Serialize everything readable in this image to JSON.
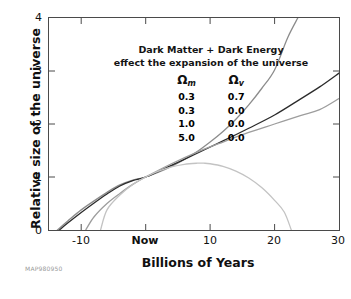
{
  "figure": {
    "credit": "MAP980950"
  },
  "chart_data": {
    "type": "line",
    "title": "Dark Matter + Dark Energy effect the expansion of the universe",
    "title_lines": [
      "Dark Matter + Dark Energy",
      "effect the expansion of the universe"
    ],
    "xlabel": "Billions of Years",
    "ylabel": "Relative size of the universe",
    "xlim": [
      -15,
      30
    ],
    "ylim": [
      0,
      4
    ],
    "grid": false,
    "legend_position": "upper-left-inside",
    "legend_headers": {
      "omega_m": "Ω",
      "omega_m_sub": "m",
      "omega_v": "Ω",
      "omega_v_sub": "v"
    },
    "xticks": [
      {
        "value": -10,
        "label": "-10",
        "bold": false
      },
      {
        "value": 0,
        "label": "Now",
        "bold": true
      },
      {
        "value": 10,
        "label": "10",
        "bold": false
      },
      {
        "value": 20,
        "label": "20",
        "bold": false
      },
      {
        "value": 30,
        "label": "30",
        "bold": false
      }
    ],
    "yticks": [
      {
        "value": 0,
        "label": "0"
      },
      {
        "value": 1,
        "label": "1"
      },
      {
        "value": 2,
        "label": "2"
      },
      {
        "value": 3,
        "label": "3"
      },
      {
        "value": 4,
        "label": "4"
      }
    ],
    "series": [
      {
        "name": "Omega_m=0.3, Omega_v=0.7",
        "omega_m": "0.3",
        "omega_v": "0.7",
        "color": "#8c8c8c",
        "description": "accelerating universe, exits top of frame",
        "x": [
          -13.7,
          -12,
          -10,
          -8,
          -6,
          -4,
          -2,
          0,
          2,
          4,
          6,
          8,
          10,
          12,
          14,
          16,
          18,
          20,
          22,
          23.6
        ],
        "y": [
          0.0,
          0.18,
          0.38,
          0.55,
          0.71,
          0.85,
          0.94,
          1.0,
          1.09,
          1.2,
          1.33,
          1.48,
          1.66,
          1.86,
          2.09,
          2.36,
          2.67,
          3.02,
          3.62,
          4.0
        ]
      },
      {
        "name": "Omega_m=0.3, Omega_v=0.0",
        "omega_m": "0.3",
        "omega_v": "0.0",
        "color": "#2b2b2b",
        "description": "open universe, coasting expansion",
        "x": [
          -13.4,
          -12,
          -10,
          -8,
          -6,
          -4,
          -2,
          0,
          4,
          8,
          12,
          16,
          20,
          24,
          27,
          30
        ],
        "y": [
          0.0,
          0.14,
          0.33,
          0.51,
          0.68,
          0.83,
          0.93,
          1.0,
          1.22,
          1.45,
          1.68,
          1.92,
          2.17,
          2.47,
          2.7,
          2.96
        ]
      },
      {
        "name": "Omega_m=1.0, Omega_v=0.0",
        "omega_m": "1.0",
        "omega_v": "0.0",
        "color": "#9d9d9d",
        "description": "flat critical-density universe, decelerating",
        "x": [
          -9.3,
          -8,
          -6,
          -4,
          -2,
          0,
          4,
          8,
          12,
          16,
          20,
          24,
          27,
          30
        ],
        "y": [
          0.0,
          0.25,
          0.5,
          0.69,
          0.86,
          1.0,
          1.25,
          1.47,
          1.66,
          1.84,
          2.0,
          2.16,
          2.27,
          2.48
        ]
      },
      {
        "name": "Omega_m=5.0, Omega_v=0.0",
        "omega_m": "5.0",
        "omega_v": "0.0",
        "color": "#c3c3c3",
        "description": "closed universe, expands to maximum then recollapses",
        "x": [
          -7.0,
          -6,
          -4,
          -2,
          0,
          2,
          4,
          6,
          8,
          9,
          10,
          12,
          14,
          16,
          18,
          20,
          21.5,
          22.6
        ],
        "y": [
          0.0,
          0.38,
          0.66,
          0.86,
          1.0,
          1.11,
          1.19,
          1.24,
          1.26,
          1.26,
          1.25,
          1.2,
          1.11,
          0.98,
          0.8,
          0.56,
          0.34,
          0.0
        ]
      }
    ]
  }
}
